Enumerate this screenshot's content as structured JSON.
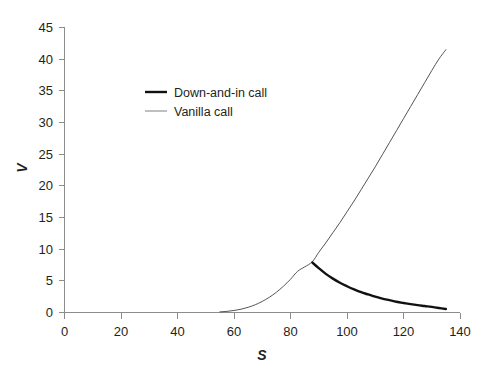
{
  "chart_data": {
    "type": "line",
    "title": "",
    "xlabel": "S",
    "ylabel": "V",
    "xlim": [
      0,
      140
    ],
    "ylim": [
      0,
      45
    ],
    "xticks": [
      0,
      20,
      40,
      60,
      80,
      100,
      120,
      140
    ],
    "yticks": [
      0,
      5,
      10,
      15,
      20,
      25,
      30,
      35,
      40,
      45
    ],
    "xtick_labels": [
      "0",
      "20",
      "40",
      "60",
      "80",
      "100",
      "120",
      "140"
    ],
    "ytick_labels": [
      "0",
      "5",
      "10",
      "15",
      "20",
      "25",
      "30",
      "35",
      "40",
      "45"
    ],
    "grid": false,
    "legend_position": "upper-left-inside",
    "background_color": "#ffffff",
    "series": [
      {
        "name": "Down-and-in call",
        "color": "#111111",
        "line_width": 2.4,
        "x": [
          87.7,
          90,
          92.5,
          95,
          97.5,
          100,
          102.5,
          105,
          107.5,
          110,
          112.5,
          115,
          117.5,
          120,
          122.5,
          125,
          127.5,
          130,
          132.5,
          135
        ],
        "y": [
          7.9,
          7.0,
          6.1,
          5.35,
          4.7,
          4.15,
          3.65,
          3.2,
          2.85,
          2.5,
          2.2,
          1.95,
          1.7,
          1.5,
          1.32,
          1.16,
          1.02,
          0.88,
          0.72,
          0.55
        ]
      },
      {
        "name": "Vanilla call",
        "color": "#555555",
        "line_width": 1.0,
        "x": [
          55,
          57.5,
          60,
          62.5,
          65,
          67.5,
          70,
          72.5,
          75,
          77.5,
          80,
          82.5,
          85,
          87.7,
          90,
          92.5,
          95,
          97.5,
          100,
          102.5,
          105,
          107.5,
          110,
          112.5,
          115,
          117.5,
          120,
          122.5,
          125,
          127.5,
          130,
          132.5,
          135
        ],
        "y": [
          0.1,
          0.18,
          0.32,
          0.52,
          0.82,
          1.22,
          1.75,
          2.4,
          3.2,
          4.15,
          5.25,
          6.5,
          7.2,
          8.0,
          9.5,
          11.0,
          12.6,
          14.2,
          15.9,
          17.6,
          19.4,
          21.2,
          23.0,
          24.9,
          26.8,
          28.7,
          30.6,
          32.5,
          34.4,
          36.3,
          38.2,
          40.0,
          41.5
        ]
      }
    ],
    "legend": [
      {
        "label": "Down-and-in call",
        "swatch": "thick-black-line"
      },
      {
        "label": "Vanilla call",
        "swatch": "thin-gray-line"
      }
    ]
  }
}
